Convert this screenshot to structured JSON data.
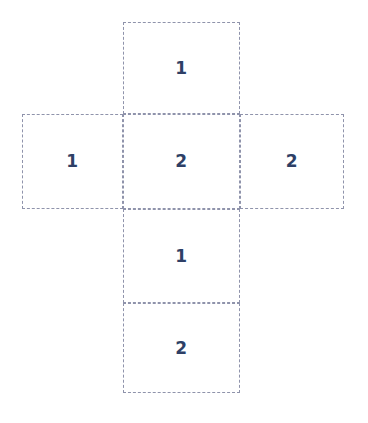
{
  "diagram": {
    "type": "cube-net",
    "background_color": "#ffffff",
    "border_color": "#8f93ab",
    "border_style": "dashed",
    "border_width_px": 1.6,
    "label_color": "#2e3f66",
    "label_font_weight": "bold",
    "label_font_size_px": 17,
    "canvas": {
      "width": 368,
      "height": 423
    },
    "cells": [
      {
        "id": "top",
        "label": "1",
        "position": "top",
        "x": 123,
        "y": 22,
        "width": 117,
        "height": 92
      },
      {
        "id": "middle-left",
        "label": "1",
        "position": "middle-left",
        "x": 22,
        "y": 114,
        "width": 101,
        "height": 95
      },
      {
        "id": "middle-center",
        "label": "2",
        "position": "middle-center",
        "x": 123,
        "y": 114,
        "width": 117,
        "height": 95
      },
      {
        "id": "middle-right",
        "label": "2",
        "position": "middle-right",
        "x": 240,
        "y": 114,
        "width": 104,
        "height": 95
      },
      {
        "id": "lower",
        "label": "1",
        "position": "lower-center",
        "x": 123,
        "y": 209,
        "width": 117,
        "height": 94
      },
      {
        "id": "bottom",
        "label": "2",
        "position": "bottom-center",
        "x": 123,
        "y": 303,
        "width": 117,
        "height": 90
      }
    ]
  }
}
